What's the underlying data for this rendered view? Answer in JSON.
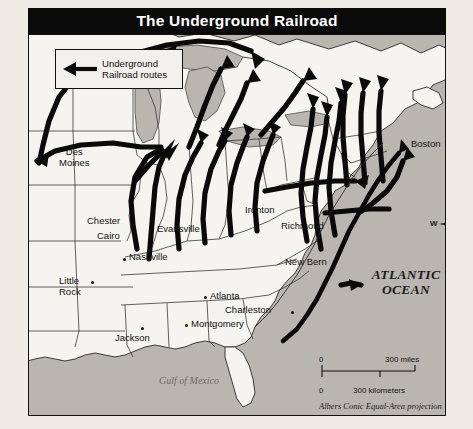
{
  "title": "The Underground Railroad",
  "legend": {
    "arrow_icon": "left-arrow-icon",
    "line1": "Underground",
    "line2": "Railroad routes"
  },
  "water_labels": {
    "atlantic_line1": "ATLANTIC",
    "atlantic_line2": "OCEAN",
    "gulf": "Gulf of Mexico"
  },
  "cities": [
    {
      "name": "Des Moines",
      "line1": "Des",
      "line2": "Moines",
      "x": 58,
      "y": 117,
      "dot": false
    },
    {
      "name": "Chester",
      "line1": "Chester",
      "line2": "",
      "x": 88,
      "y": 213,
      "dot": false
    },
    {
      "name": "Cairo",
      "line1": "Cairo",
      "line2": "",
      "x": 95,
      "y": 228,
      "dot": false
    },
    {
      "name": "Evansville",
      "line1": "Evansville",
      "line2": "",
      "x": 160,
      "y": 220,
      "dot": false
    },
    {
      "name": "Ironton",
      "line1": "Ironton",
      "line2": "",
      "x": 243,
      "y": 203,
      "dot": false
    },
    {
      "name": "Richmond",
      "line1": "Richmond",
      "line2": "",
      "x": 279,
      "y": 218,
      "dot": false
    },
    {
      "name": "Nashville",
      "line1": "Nashville",
      "line2": "",
      "x": 128,
      "y": 253,
      "dot": true
    },
    {
      "name": "New Bern",
      "line1": "New Bern",
      "line2": "",
      "x": 285,
      "y": 255,
      "dot": false
    },
    {
      "name": "Boston",
      "line1": "Boston",
      "line2": "",
      "x": 412,
      "y": 139,
      "dot": false
    },
    {
      "name": "Little Rock",
      "line1": "Little",
      "line2": "Rock",
      "x": 61,
      "y": 278,
      "dot": true
    },
    {
      "name": "Jackson",
      "line1": "Jackson",
      "line2": "",
      "x": 113,
      "y": 333,
      "dot": true
    },
    {
      "name": "Montgomery",
      "line1": "Montgomery",
      "line2": "",
      "x": 189,
      "y": 326,
      "dot": true
    },
    {
      "name": "Atlanta",
      "line1": "Atlanta",
      "line2": "",
      "x": 201,
      "y": 297,
      "dot": true
    },
    {
      "name": "Charleston",
      "line1": "Charleston",
      "line2": "",
      "x": 251,
      "y": 310,
      "dot": true
    }
  ],
  "compass": {
    "north": "N",
    "east": "E",
    "south": "S",
    "west": "W"
  },
  "scale": {
    "miles_start": "0",
    "miles_value": "300 miles",
    "km_start": "0",
    "km_value": "300 kilometers",
    "projection": "Albers Conic Equal-Area projection"
  },
  "colors": {
    "banner": "#0a0a0a",
    "banner_text": "#ffffff",
    "land": "#f6f4ee",
    "water": "#b9b6b0",
    "route": "#0a0a0a",
    "border": "#111111"
  }
}
